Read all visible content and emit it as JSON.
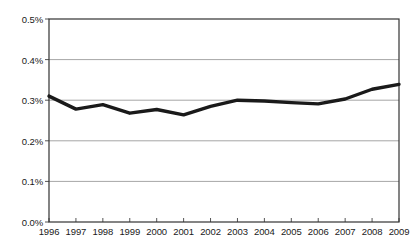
{
  "chart_data": {
    "type": "line",
    "title": "",
    "subtitle": "",
    "xlabel": "",
    "ylabel": "",
    "x": [
      1996,
      1997,
      1998,
      1999,
      2000,
      2001,
      2002,
      2003,
      2004,
      2005,
      2006,
      2007,
      2008,
      2009
    ],
    "categories": [
      "1996",
      "1997",
      "1998",
      "1999",
      "2000",
      "2001",
      "2002",
      "2003",
      "2004",
      "2005",
      "2006",
      "2007",
      "2008",
      "2009"
    ],
    "values": [
      0.31,
      0.278,
      0.289,
      0.268,
      0.277,
      0.264,
      0.285,
      0.3,
      0.298,
      0.294,
      0.291,
      0.303,
      0.327,
      0.339
    ],
    "series": [
      {
        "name": "",
        "values": [
          0.31,
          0.278,
          0.289,
          0.268,
          0.277,
          0.264,
          0.285,
          0.3,
          0.298,
          0.294,
          0.291,
          0.303,
          0.327,
          0.339
        ],
        "color": "#1a1a1a",
        "line_width": 3.4
      }
    ],
    "ylim": [
      0.0,
      0.5
    ],
    "xlim": [
      1996,
      2009
    ],
    "ytick_values": [
      0.0,
      0.1,
      0.2,
      0.3,
      0.4,
      0.5
    ],
    "ytick_labels": [
      "0.0%",
      "0.1%",
      "0.2%",
      "0.3%",
      "0.4%",
      "0.5%"
    ],
    "xtick_labels": [
      "1996",
      "1997",
      "1998",
      "1999",
      "2000",
      "2001",
      "2002",
      "2003",
      "2004",
      "2005",
      "2006",
      "2007",
      "2008",
      "2009"
    ],
    "grid": {
      "horizontal": true,
      "vertical": false,
      "color": "#a6a6a6"
    },
    "legend": {
      "visible": false,
      "position": "none",
      "entries": []
    },
    "annotations": [],
    "value_unit": "percent",
    "value_format": "0.0%"
  },
  "style": {
    "background": "#ffffff",
    "plot_border_color": "#333333",
    "gridline_color": "#a6a6a6",
    "line_color": "#1a1a1a",
    "tick_color": "#555555",
    "label_color": "#1a1a1a"
  },
  "geometry": {
    "plot_left": 49,
    "plot_right": 399,
    "plot_top": 19,
    "plot_bottom": 222
  }
}
